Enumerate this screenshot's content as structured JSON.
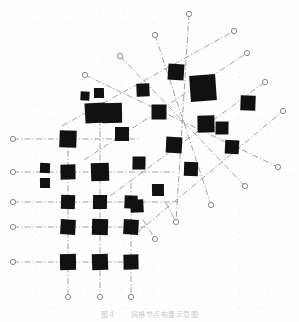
{
  "figure": {
    "caption": "图４　　网格节点布置示意图",
    "alt_title": "Grid node layout schematic",
    "width": 299,
    "height": 322,
    "background_color": "#fefefe",
    "node_color": "#111111",
    "line_color": "#8a8a8a",
    "terminal_color": "#7a7a7a",
    "caption_color": "#c9c9c9",
    "line_style": "dash-dot",
    "line_width": 0.8
  },
  "chart_data": {
    "type": "scatter",
    "title": "图４　　网格节点布置示意图",
    "xlabel": "",
    "ylabel": "",
    "xlim": [
      0,
      299
    ],
    "ylim": [
      0,
      322
    ],
    "grid": false,
    "legend": null,
    "note": "Filled black square markers of varying size placed on two overlaid line networks: an orthogonal grid in the lower-left and a ~45-degree rotated grid in the upper-right. Dash-dot lines terminate at small open circles.",
    "marker_shape": "filled-square",
    "terminal_shape": "open-circle",
    "nodes": [
      {
        "id": "n01",
        "x": 68,
        "y": 139,
        "size": 17
      },
      {
        "id": "n02",
        "x": 68,
        "y": 172,
        "size": 15
      },
      {
        "id": "n03",
        "x": 68,
        "y": 202,
        "size": 14
      },
      {
        "id": "n04",
        "x": 68,
        "y": 227,
        "size": 15
      },
      {
        "id": "n05",
        "x": 68,
        "y": 262,
        "size": 16
      },
      {
        "id": "n06",
        "x": 45,
        "y": 168,
        "size": 10
      },
      {
        "id": "n07",
        "x": 45,
        "y": 183,
        "size": 10
      },
      {
        "id": "n08",
        "x": 100,
        "y": 172,
        "size": 18
      },
      {
        "id": "n09",
        "x": 100,
        "y": 202,
        "size": 14
      },
      {
        "id": "n10",
        "x": 100,
        "y": 227,
        "size": 16
      },
      {
        "id": "n11",
        "x": 100,
        "y": 262,
        "size": 16
      },
      {
        "id": "n12",
        "x": 131,
        "y": 202,
        "size": 13
      },
      {
        "id": "n13",
        "x": 131,
        "y": 227,
        "size": 15
      },
      {
        "id": "n14",
        "x": 131,
        "y": 262,
        "size": 15
      },
      {
        "id": "n15",
        "x": 85,
        "y": 96,
        "size": 9
      },
      {
        "id": "n16",
        "x": 99,
        "y": 93,
        "size": 10
      },
      {
        "id": "n17",
        "x": 95,
        "y": 113,
        "size": 20
      },
      {
        "id": "n18",
        "x": 112,
        "y": 113,
        "size": 20
      },
      {
        "id": "n19",
        "x": 122,
        "y": 134,
        "size": 14
      },
      {
        "id": "n20",
        "x": 143,
        "y": 90,
        "size": 13
      },
      {
        "id": "n21",
        "x": 159,
        "y": 112,
        "size": 15
      },
      {
        "id": "n22",
        "x": 139,
        "y": 163,
        "size": 13
      },
      {
        "id": "n23",
        "x": 137,
        "y": 206,
        "size": 13
      },
      {
        "id": "n24",
        "x": 158,
        "y": 190,
        "size": 12
      },
      {
        "id": "n25",
        "x": 176,
        "y": 72,
        "size": 16
      },
      {
        "id": "n26",
        "x": 174,
        "y": 145,
        "size": 16
      },
      {
        "id": "n27",
        "x": 191,
        "y": 169,
        "size": 14
      },
      {
        "id": "n28",
        "x": 206,
        "y": 124,
        "size": 17
      },
      {
        "id": "n29",
        "x": 203,
        "y": 88,
        "size": 26
      },
      {
        "id": "n30",
        "x": 232,
        "y": 147,
        "size": 14
      },
      {
        "id": "n31",
        "x": 248,
        "y": 103,
        "size": 15
      },
      {
        "id": "n32",
        "x": 222,
        "y": 128,
        "size": 13
      }
    ],
    "orthogonal_rows": [
      139,
      172,
      202,
      227,
      262
    ],
    "orthogonal_cols": [
      68,
      100,
      131
    ],
    "terminals_left": [
      {
        "x": 13,
        "y": 139
      },
      {
        "x": 13,
        "y": 172
      },
      {
        "x": 13,
        "y": 202
      },
      {
        "x": 13,
        "y": 227
      },
      {
        "x": 13,
        "y": 262
      }
    ],
    "terminals_bottom": [
      {
        "x": 68,
        "y": 297
      },
      {
        "x": 100,
        "y": 297
      },
      {
        "x": 131,
        "y": 297
      }
    ],
    "terminals_top_left_diag": [
      {
        "x": 85,
        "y": 75
      },
      {
        "x": 120,
        "y": 56
      },
      {
        "x": 155,
        "y": 35
      },
      {
        "x": 189,
        "y": 14
      }
    ],
    "terminals_right_diag": [
      {
        "x": 234,
        "y": 31
      },
      {
        "x": 247,
        "y": 53
      },
      {
        "x": 265,
        "y": 82
      },
      {
        "x": 283,
        "y": 111
      }
    ],
    "terminals_bottom_diag": [
      {
        "x": 155,
        "y": 239
      },
      {
        "x": 176,
        "y": 222
      },
      {
        "x": 211,
        "y": 205
      },
      {
        "x": 245,
        "y": 186
      },
      {
        "x": 278,
        "y": 167
      }
    ]
  }
}
